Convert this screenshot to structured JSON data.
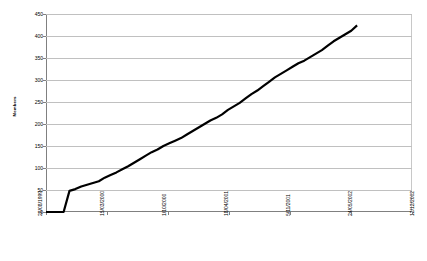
{
  "chart_data": {
    "type": "line",
    "title": "",
    "xlabel": "",
    "ylabel": "Members",
    "ylim": [
      0,
      450
    ],
    "ytick_labels": [
      "0",
      "50",
      "100",
      "150",
      "200",
      "250",
      "300",
      "350",
      "400",
      "450"
    ],
    "ytick_values": [
      0,
      50,
      100,
      150,
      200,
      250,
      300,
      350,
      400,
      450
    ],
    "xtick_labels": [
      "28/08/1999",
      "15/03/2000",
      "1/10/2000",
      "18/04/2001",
      "5/11/2001",
      "24/05/2002",
      "12/12/2002"
    ],
    "grid": "horizontal",
    "legend": "none",
    "line_color": "#000000",
    "gridline_color": "#c0c0c0",
    "axis_color": "#808080",
    "series": [
      {
        "name": "Members",
        "x": [
          "28/08/1999",
          "15/10/1999",
          "20/11/1999",
          "05/12/1999",
          "06/12/1999",
          "20/12/1999",
          "10/01/2000",
          "01/02/2000",
          "25/02/2000",
          "15/03/2000",
          "05/04/2000",
          "28/04/2000",
          "20/05/2000",
          "10/06/2000",
          "01/07/2000",
          "20/07/2000",
          "10/08/2000",
          "01/09/2000",
          "20/09/2000",
          "01/10/2000",
          "20/10/2000",
          "10/11/2000",
          "01/12/2000",
          "20/12/2000",
          "10/01/2001",
          "01/02/2001",
          "20/02/2001",
          "10/03/2001",
          "01/04/2001",
          "18/04/2001",
          "05/05/2001",
          "25/05/2001",
          "15/06/2001",
          "05/07/2001",
          "25/07/2001",
          "15/08/2001",
          "05/09/2001",
          "25/09/2001",
          "15/10/2001",
          "05/11/2001",
          "25/11/2001",
          "15/12/2001",
          "05/01/2002",
          "25/01/2002",
          "15/02/2002",
          "05/03/2002",
          "25/03/2002",
          "15/04/2002",
          "05/05/2002",
          "24/05/2002",
          "10/06/2002",
          "25/06/2002",
          "10/07/2002",
          "25/07/2002"
        ],
        "values": [
          0,
          0,
          0,
          0,
          48,
          52,
          58,
          62,
          66,
          70,
          78,
          84,
          90,
          97,
          104,
          112,
          120,
          128,
          136,
          142,
          150,
          156,
          162,
          168,
          176,
          184,
          192,
          200,
          208,
          214,
          222,
          232,
          240,
          248,
          258,
          268,
          276,
          286,
          296,
          306,
          314,
          322,
          330,
          338,
          344,
          352,
          360,
          368,
          378,
          388,
          396,
          404,
          412,
          424
        ]
      }
    ]
  }
}
